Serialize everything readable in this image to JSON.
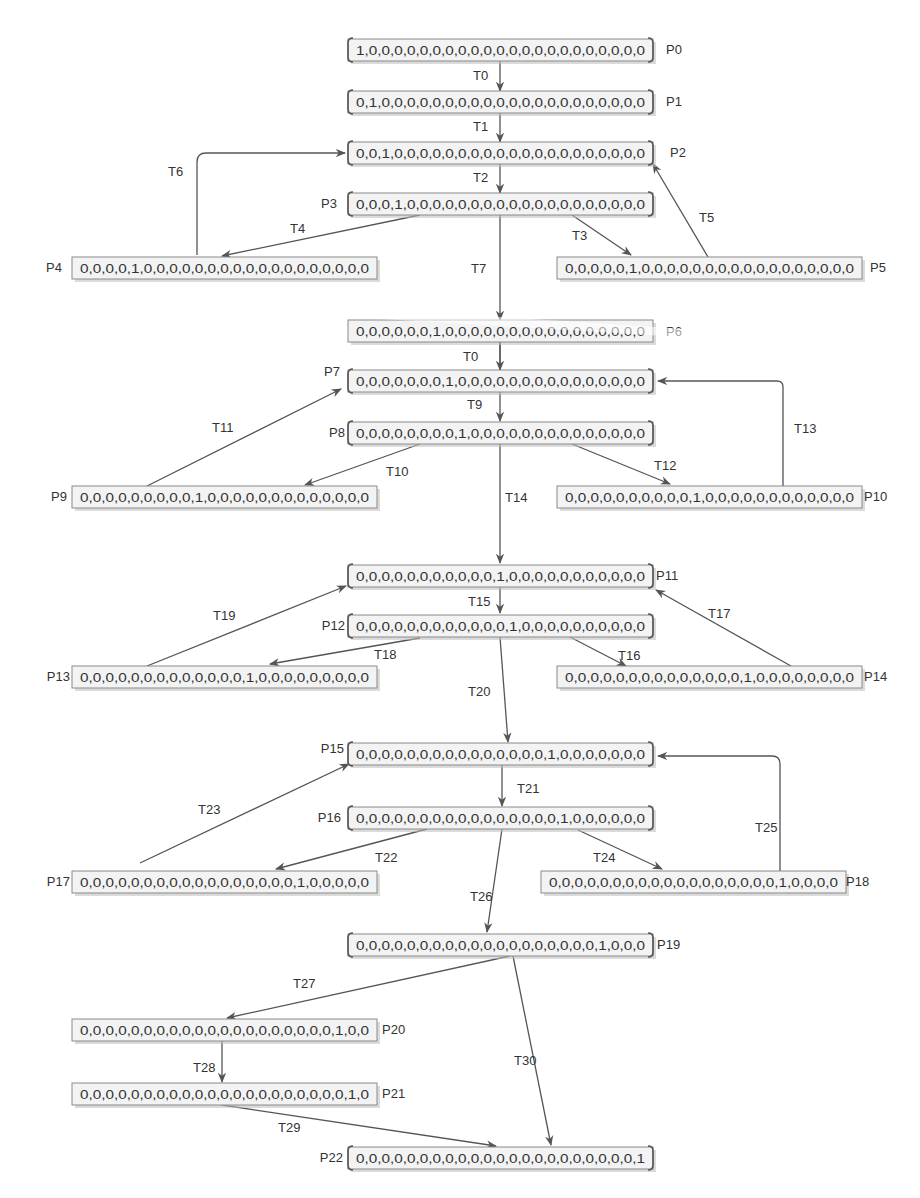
{
  "diagram": {
    "type": "reachability-graph",
    "places": [
      {
        "id": "P0",
        "label": "P0",
        "marking": "1,0,0,0,0,0,0,0,0,0,0,0,0,0,0,0,0,0,0,0,0,0,0",
        "brackets": true
      },
      {
        "id": "P1",
        "label": "P1",
        "marking": "0,1,0,0,0,0,0,0,0,0,0,0,0,0,0,0,0,0,0,0,0,0,0",
        "brackets": true
      },
      {
        "id": "P2",
        "label": "P2",
        "marking": "0,0,1,0,0,0,0,0,0,0,0,0,0,0,0,0,0,0,0,0,0,0,0",
        "brackets": true
      },
      {
        "id": "P3",
        "label": "P3",
        "marking": "0,0,0,1,0,0,0,0,0,0,0,0,0,0,0,0,0,0,0,0,0,0,0",
        "brackets": true
      },
      {
        "id": "P4",
        "label": "P4",
        "marking": "0,0,0,0,1,0,0,0,0,0,0,0,0,0,0,0,0,0,0,0,0,0,0",
        "brackets": false
      },
      {
        "id": "P5",
        "label": "P5",
        "marking": "0,0,0,0,0,1,0,0,0,0,0,0,0,0,0,0,0,0,0,0,0,0,0",
        "brackets": false
      },
      {
        "id": "P6",
        "label": "P6",
        "marking": "0,0,0,0,0,0,1,0,0,0,0,0,0,0,0,0,0,0,0,0,0,0,0",
        "brackets": false
      },
      {
        "id": "P7",
        "label": "P7",
        "marking": "0,0,0,0,0,0,0,1,0,0,0,0,0,0,0,0,0,0,0,0,0,0,0",
        "brackets": true
      },
      {
        "id": "P8",
        "label": "P8",
        "marking": "0,0,0,0,0,0,0,0,1,0,0,0,0,0,0,0,0,0,0,0,0,0,0",
        "brackets": true
      },
      {
        "id": "P9",
        "label": "P9",
        "marking": "0,0,0,0,0,0,0,0,0,1,0,0,0,0,0,0,0,0,0,0,0,0,0",
        "brackets": false
      },
      {
        "id": "P10",
        "label": "P10",
        "marking": "0,0,0,0,0,0,0,0,0,0,1,0,0,0,0,0,0,0,0,0,0,0,0",
        "brackets": false
      },
      {
        "id": "P11",
        "label": "P11",
        "marking": "0,0,0,0,0,0,0,0,0,0,0,1,0,0,0,0,0,0,0,0,0,0,0",
        "brackets": true
      },
      {
        "id": "P12",
        "label": "P12",
        "marking": "0,0,0,0,0,0,0,0,0,0,0,0,1,0,0,0,0,0,0,0,0,0,0",
        "brackets": true
      },
      {
        "id": "P13",
        "label": "P13",
        "marking": "0,0,0,0,0,0,0,0,0,0,0,0,0,1,0,0,0,0,0,0,0,0,0",
        "brackets": false
      },
      {
        "id": "P14",
        "label": "P14",
        "marking": "0,0,0,0,0,0,0,0,0,0,0,0,0,0,1,0,0,0,0,0,0,0,0",
        "brackets": false
      },
      {
        "id": "P15",
        "label": "P15",
        "marking": "0,0,0,0,0,0,0,0,0,0,0,0,0,0,0,1,0,0,0,0,0,0,0",
        "brackets": true
      },
      {
        "id": "P16",
        "label": "P16",
        "marking": "0,0,0,0,0,0,0,0,0,0,0,0,0,0,0,0,1,0,0,0,0,0,0",
        "brackets": true
      },
      {
        "id": "P17",
        "label": "P17",
        "marking": "0,0,0,0,0,0,0,0,0,0,0,0,0,0,0,0,0,1,0,0,0,0,0",
        "brackets": false
      },
      {
        "id": "P18",
        "label": "P18",
        "marking": "0,0,0,0,0,0,0,0,0,0,0,0,0,0,0,0,0,0,1,0,0,0,0",
        "brackets": false
      },
      {
        "id": "P19",
        "label": "P19",
        "marking": "0,0,0,0,0,0,0,0,0,0,0,0,0,0,0,0,0,0,0,1,0,0,0",
        "brackets": true
      },
      {
        "id": "P20",
        "label": "P20",
        "marking": "0,0,0,0,0,0,0,0,0,0,0,0,0,0,0,0,0,0,0,0,1,0,0",
        "brackets": false
      },
      {
        "id": "P21",
        "label": "P21",
        "marking": "0,0,0,0,0,0,0,0,0,0,0,0,0,0,0,0,0,0,0,0,0,1,0",
        "brackets": false
      },
      {
        "id": "P22",
        "label": "P22",
        "marking": "0,0,0,0,0,0,0,0,0,0,0,0,0,0,0,0,0,0,0,0,0,0,1",
        "brackets": true
      }
    ],
    "transitions": [
      {
        "label": "T0",
        "from": "P0",
        "to": "P1"
      },
      {
        "label": "T1",
        "from": "P1",
        "to": "P2"
      },
      {
        "label": "T2",
        "from": "P2",
        "to": "P3"
      },
      {
        "label": "T3",
        "from": "P3",
        "to": "P5"
      },
      {
        "label": "T4",
        "from": "P3",
        "to": "P4"
      },
      {
        "label": "T5",
        "from": "P5",
        "to": "P2"
      },
      {
        "label": "T6",
        "from": "P4",
        "to": "P2"
      },
      {
        "label": "T7",
        "from": "P3",
        "to": "P6"
      },
      {
        "label": "T0",
        "from": "P6",
        "to": "P7"
      },
      {
        "label": "T9",
        "from": "P7",
        "to": "P8"
      },
      {
        "label": "T10",
        "from": "P8",
        "to": "P9"
      },
      {
        "label": "T11",
        "from": "P9",
        "to": "P7"
      },
      {
        "label": "T12",
        "from": "P8",
        "to": "P10"
      },
      {
        "label": "T13",
        "from": "P10",
        "to": "P7"
      },
      {
        "label": "T14",
        "from": "P8",
        "to": "P11"
      },
      {
        "label": "T15",
        "from": "P11",
        "to": "P12"
      },
      {
        "label": "T16",
        "from": "P12",
        "to": "P14"
      },
      {
        "label": "T17",
        "from": "P14",
        "to": "P11"
      },
      {
        "label": "T18",
        "from": "P12",
        "to": "P13"
      },
      {
        "label": "T19",
        "from": "P13",
        "to": "P11"
      },
      {
        "label": "T20",
        "from": "P12",
        "to": "P15"
      },
      {
        "label": "T21",
        "from": "P15",
        "to": "P16"
      },
      {
        "label": "T22",
        "from": "P16",
        "to": "P17"
      },
      {
        "label": "T23",
        "from": "P17",
        "to": "P15"
      },
      {
        "label": "T24",
        "from": "P16",
        "to": "P18"
      },
      {
        "label": "T25",
        "from": "P18",
        "to": "P15"
      },
      {
        "label": "T26",
        "from": "P16",
        "to": "P19"
      },
      {
        "label": "T27",
        "from": "P19",
        "to": "P20"
      },
      {
        "label": "T28",
        "from": "P20",
        "to": "P21"
      },
      {
        "label": "T29",
        "from": "P21",
        "to": "P22"
      },
      {
        "label": "T30",
        "from": "P19",
        "to": "P22"
      }
    ]
  }
}
